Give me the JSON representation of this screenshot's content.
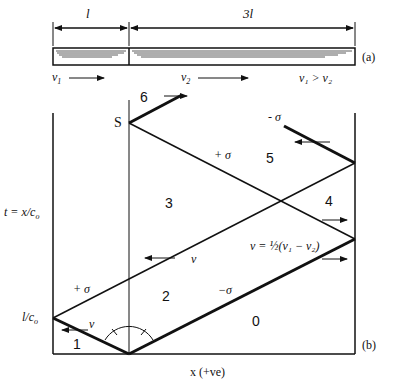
{
  "figure": {
    "part_a": {
      "tag": "(a)",
      "length_left": "l",
      "length_right": "3l",
      "velocity_left": "v",
      "velocity_left_sub": "1",
      "velocity_right": "v",
      "velocity_right_sub": "2",
      "condition": "v₁ > v₂"
    },
    "part_b": {
      "tag": "(b)",
      "y_axis_label": "t = x/c",
      "y_axis_sub": "o",
      "y_tick": "l/c",
      "y_tick_sub": "o",
      "x_axis_label": "x (+ve)",
      "point_s": "S",
      "regions": [
        "0",
        "1",
        "2",
        "3",
        "4",
        "5",
        "6"
      ],
      "wave_labels": {
        "plus_sigma_lower": "+ σ",
        "plus_sigma_upper": "+ σ",
        "minus_sigma_lower": "−σ",
        "minus_sigma_upper": "- σ"
      },
      "velocity_label_1": "v",
      "velocity_label_2": "v",
      "velocity_formula": "v = ½(v₁ − v₂)"
    }
  }
}
